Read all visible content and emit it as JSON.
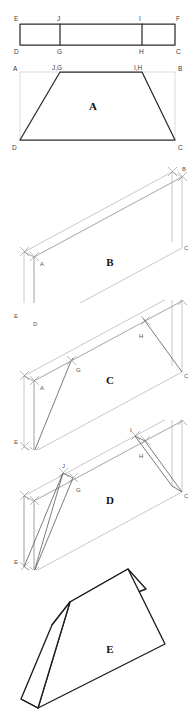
{
  "figure": {
    "caption": "",
    "panels": [
      {
        "id": "A",
        "label": "A",
        "kind": "orthographic-trapezoid",
        "description": "Front view: trapezoid D-G-H-C inscribed in rectangle A-B-C-D",
        "vertex_labels": [
          "A",
          "B",
          "C",
          "D",
          "J,G",
          "I,H"
        ]
      },
      {
        "id": "B",
        "label": "B",
        "kind": "isometric-box",
        "description": "Isometric rectangular block",
        "vertex_labels": [
          "A",
          "B",
          "C",
          "D",
          "E"
        ]
      },
      {
        "id": "C",
        "label": "C",
        "kind": "isometric-box-with-lines",
        "description": "Isometric block with construction lines to G and H",
        "vertex_labels": [
          "A",
          "B",
          "C",
          "D",
          "E",
          "G",
          "H"
        ]
      },
      {
        "id": "D",
        "label": "D",
        "kind": "isometric-box-cut",
        "description": "Isometric block with cut planes through G, H, I, J",
        "vertex_labels": [
          "A",
          "B",
          "C",
          "D",
          "E",
          "G",
          "H",
          "I",
          "J"
        ]
      },
      {
        "id": "E",
        "label": "E",
        "kind": "isometric-solid",
        "description": "Finished wedge / trapezoidal prism solid",
        "vertex_labels": []
      }
    ],
    "strip": {
      "top_labels": [
        "E",
        "J",
        "I",
        "F"
      ],
      "bottom_labels": [
        "D",
        "G",
        "H",
        "C"
      ]
    },
    "panel_a_labels": {
      "top_left": "A",
      "top_right": "B",
      "bottom_left": "D",
      "bottom_right": "C",
      "inner_left": "J,G",
      "inner_right": "I,H",
      "area": "A"
    },
    "panel_b_labels": {
      "a": "A",
      "b": "B",
      "c": "C",
      "d": "D",
      "e": "E",
      "area": "B"
    },
    "panel_c_labels": {
      "a": "A",
      "b": "B",
      "c": "C",
      "d": "D",
      "e": "E",
      "g": "G",
      "h": "H",
      "area": "C"
    },
    "panel_d_labels": {
      "a": "A",
      "b": "B",
      "c": "C",
      "d": "D",
      "e": "E",
      "g": "G",
      "h": "H",
      "i": "I",
      "j": "J",
      "area": "D"
    },
    "panel_e_labels": {
      "area": "E"
    },
    "colors": {
      "heavy_line": "#2b2b2b",
      "construction_line": "#9a9a9a",
      "solid_outline": "#1c1c1c",
      "label_text": "#3a3a3a",
      "background": "#ffffff"
    }
  }
}
